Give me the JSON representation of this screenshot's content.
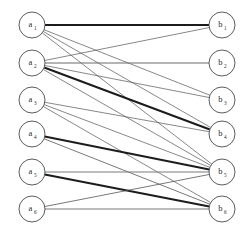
{
  "figure": {
    "type": "bipartite-graph",
    "title": "",
    "background_color": "#ffffff",
    "width": 251,
    "height": 236
  },
  "nodes": {
    "left_set": [
      {
        "id": "a1",
        "label": "a",
        "sub": "1",
        "cx": 32,
        "cy": 25,
        "r": 13
      },
      {
        "id": "a2",
        "label": "a",
        "sub": "2",
        "cx": 32,
        "cy": 63,
        "r": 13
      },
      {
        "id": "a3",
        "label": "a",
        "sub": "3",
        "cx": 32,
        "cy": 100,
        "r": 13
      },
      {
        "id": "a4",
        "label": "a",
        "sub": "4",
        "cx": 32,
        "cy": 134,
        "r": 13
      },
      {
        "id": "a5",
        "label": "a",
        "sub": "5",
        "cx": 32,
        "cy": 172,
        "r": 13
      },
      {
        "id": "a6",
        "label": "a",
        "sub": "6",
        "cx": 32,
        "cy": 209,
        "r": 13
      }
    ],
    "right_set": [
      {
        "id": "b1",
        "label": "b",
        "sub": "1",
        "cx": 222,
        "cy": 25,
        "r": 13
      },
      {
        "id": "b2",
        "label": "b",
        "sub": "2",
        "cx": 222,
        "cy": 63,
        "r": 13
      },
      {
        "id": "b3",
        "label": "b",
        "sub": "3",
        "cx": 222,
        "cy": 100,
        "r": 13
      },
      {
        "id": "b4",
        "label": "b",
        "sub": "4",
        "cx": 222,
        "cy": 134,
        "r": 13
      },
      {
        "id": "b5",
        "label": "b",
        "sub": "5",
        "cx": 222,
        "cy": 172,
        "r": 13
      },
      {
        "id": "b6",
        "label": "b",
        "sub": "6",
        "cx": 222,
        "cy": 209,
        "r": 13
      }
    ]
  },
  "edges": [
    {
      "from": "a1",
      "to": "b1",
      "weight": "heavy",
      "color": "#1c1c1c",
      "width": 2.2
    },
    {
      "from": "a1",
      "to": "b3",
      "weight": "light",
      "color": "#555555",
      "width": 0.7
    },
    {
      "from": "a1",
      "to": "b4",
      "weight": "light",
      "color": "#555555",
      "width": 0.7
    },
    {
      "from": "a1",
      "to": "b5",
      "weight": "light",
      "color": "#555555",
      "width": 0.7
    },
    {
      "from": "a2",
      "to": "b1",
      "weight": "light",
      "color": "#555555",
      "width": 0.7
    },
    {
      "from": "a2",
      "to": "b2",
      "weight": "medium",
      "color": "#6a6a6a",
      "width": 1.1
    },
    {
      "from": "a2",
      "to": "b3",
      "weight": "light",
      "color": "#555555",
      "width": 0.7
    },
    {
      "from": "a2",
      "to": "b4",
      "weight": "heavy",
      "color": "#1c1c1c",
      "width": 2.0
    },
    {
      "from": "a2",
      "to": "b5",
      "weight": "light",
      "color": "#555555",
      "width": 0.7
    },
    {
      "from": "a3",
      "to": "b4",
      "weight": "light",
      "color": "#555555",
      "width": 0.7
    },
    {
      "from": "a3",
      "to": "b5",
      "weight": "light",
      "color": "#555555",
      "width": 0.7
    },
    {
      "from": "a3",
      "to": "b6",
      "weight": "light",
      "color": "#555555",
      "width": 0.7
    },
    {
      "from": "a4",
      "to": "b5",
      "weight": "heavy",
      "color": "#1c1c1c",
      "width": 1.9
    },
    {
      "from": "a4",
      "to": "b6",
      "weight": "light",
      "color": "#555555",
      "width": 0.8
    },
    {
      "from": "a5",
      "to": "b5",
      "weight": "medium",
      "color": "#7a7a7a",
      "width": 1.2
    },
    {
      "from": "a5",
      "to": "b6",
      "weight": "heavy",
      "color": "#1c1c1c",
      "width": 1.9
    },
    {
      "from": "a6",
      "to": "b5",
      "weight": "light",
      "color": "#555555",
      "width": 0.8
    },
    {
      "from": "a6",
      "to": "b6",
      "weight": "medium",
      "color": "#7a7a7a",
      "width": 1.2
    }
  ],
  "legend": {
    "present": false,
    "items": []
  },
  "axes": {
    "present": false
  }
}
